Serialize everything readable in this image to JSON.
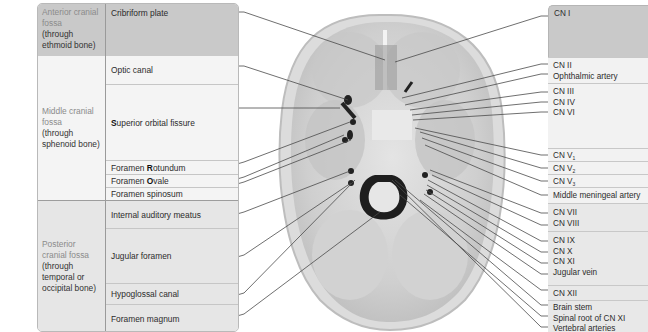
{
  "left_table": {
    "anterior": {
      "label_accent": "Anterior cranial fossa",
      "label_sub": "(through ethmoid bone)",
      "rows": [
        {
          "pre": "",
          "bold": "",
          "text": "Cribriform plate"
        }
      ]
    },
    "middle": {
      "label_accent": "Middle cranial fossa",
      "label_sub": "(through sphenoid bone)",
      "rows": [
        {
          "pre": "",
          "bold": "",
          "text": "Optic canal"
        },
        {
          "pre": "",
          "bold": "S",
          "text": "uperior orbital fissure"
        },
        {
          "pre": "Foramen ",
          "bold": "R",
          "text": "otundum"
        },
        {
          "pre": "Foramen ",
          "bold": "O",
          "text": "vale"
        },
        {
          "pre": "",
          "bold": "",
          "text": "Foramen spinosum"
        }
      ]
    },
    "posterior": {
      "label_accent": "Posterior cranial fossa",
      "label_sub": "(through temporal or occipital bone)",
      "rows": [
        {
          "pre": "",
          "bold": "",
          "text": "Internal auditory meatus"
        },
        {
          "pre": "",
          "bold": "",
          "text": "Jugular foramen"
        },
        {
          "pre": "",
          "bold": "",
          "text": "Hypoglossal canal"
        },
        {
          "pre": "",
          "bold": "",
          "text": "Foramen magnum"
        }
      ]
    }
  },
  "right_panel": {
    "groups": [
      {
        "lines": [
          "CN I"
        ]
      },
      {
        "lines": [
          "CN II",
          "Ophthalmic artery"
        ]
      },
      {
        "lines": [
          "CN III",
          "CN IV",
          "CN VI"
        ]
      },
      {
        "lines": [
          "CN V1"
        ],
        "base": "CN V",
        "sub": "1"
      },
      {
        "lines": [
          "CN V2"
        ],
        "base": "CN V",
        "sub": "2"
      },
      {
        "lines": [
          "CN V3"
        ],
        "base": "CN V",
        "sub": "3"
      },
      {
        "lines": [
          "Middle meningeal artery"
        ]
      },
      {
        "lines": [
          "CN VII",
          "CN VIII"
        ]
      },
      {
        "lines": [
          "CN IX",
          "CN X",
          "CN XI",
          "Jugular vein"
        ]
      },
      {
        "lines": [
          "CN XII"
        ]
      },
      {
        "lines": [
          "Brain stem",
          "Spinal root of CN XI",
          "Vertebral arteries"
        ]
      }
    ]
  },
  "image": {
    "subject": "skull-base-superior-view",
    "leader_line_color": "#4a4a4a"
  }
}
